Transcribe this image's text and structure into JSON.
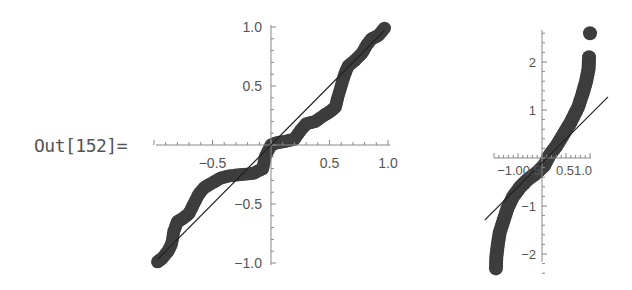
{
  "cell": {
    "out_label": "Out[152]="
  },
  "colors": {
    "dot": "#3d3d3d",
    "axis": "#888888",
    "line": "#222222",
    "text": "#555555"
  },
  "chart_data": [
    {
      "type": "scatter",
      "title": "",
      "xlabel": "",
      "ylabel": "",
      "xlim": [
        -1.0,
        1.0
      ],
      "ylim": [
        -1.0,
        1.0
      ],
      "x_ticks": [
        -0.5,
        0.5,
        1.0
      ],
      "x_tick_labels": [
        "-0.5",
        "0.5",
        "1.0"
      ],
      "y_ticks": [
        1.0,
        0.5,
        -0.5,
        -1.0
      ],
      "y_tick_labels": [
        "1.0",
        "0.5",
        "-0.5",
        "-1.0"
      ],
      "grid": false,
      "legend": null,
      "reference_line": {
        "slope": 1.0,
        "intercept": 0.0,
        "x_range": [
          -0.97,
          0.97
        ]
      },
      "series": [
        {
          "name": "quantiles",
          "x": [
            -0.97,
            -0.93,
            -0.88,
            -0.85,
            -0.83,
            -0.8,
            -0.75,
            -0.7,
            -0.66,
            -0.62,
            -0.57,
            -0.5,
            -0.43,
            -0.35,
            -0.25,
            -0.15,
            -0.07,
            -0.05,
            0.0,
            0.05,
            0.12,
            0.2,
            0.25,
            0.3,
            0.38,
            0.45,
            0.5,
            0.55,
            0.57,
            0.6,
            0.63,
            0.66,
            0.72,
            0.78,
            0.82,
            0.86,
            0.92,
            0.97
          ],
          "y": [
            -0.99,
            -0.96,
            -0.9,
            -0.84,
            -0.73,
            -0.65,
            -0.62,
            -0.58,
            -0.5,
            -0.42,
            -0.36,
            -0.32,
            -0.28,
            -0.26,
            -0.25,
            -0.24,
            -0.2,
            -0.1,
            0.0,
            0.02,
            0.03,
            0.05,
            0.12,
            0.18,
            0.2,
            0.25,
            0.28,
            0.32,
            0.4,
            0.5,
            0.6,
            0.67,
            0.72,
            0.78,
            0.85,
            0.9,
            0.93,
            0.99
          ]
        }
      ]
    },
    {
      "type": "scatter",
      "title": "",
      "xlabel": "",
      "ylabel": "",
      "xlim": [
        -1.0,
        1.0
      ],
      "ylim": [
        -2.6,
        2.7
      ],
      "x_ticks": [
        -1.0,
        -0.5,
        0.5,
        1.0
      ],
      "x_tick_labels": [
        "-1.0",
        "0.5",
        "0.5",
        "1.0"
      ],
      "x_tick_label_text": {
        "left": "-1.00.5",
        "right": "0.51.0"
      },
      "y_ticks": [
        2,
        1,
        -1,
        -2
      ],
      "y_tick_labels": [
        "2",
        "1",
        "-1",
        "-2"
      ],
      "grid": false,
      "legend": null,
      "reference_line": {
        "slope": 1.0,
        "intercept": -0.1,
        "x_range": [
          -1.19,
          1.375
        ]
      },
      "series": [
        {
          "name": "quantiles",
          "x": [
            1.0,
            0.98,
            0.97,
            0.92,
            0.85,
            0.75,
            0.6,
            0.45,
            0.3,
            0.15,
            0.05,
            -0.1,
            -0.3,
            -0.45,
            -0.6,
            -0.72,
            -0.8,
            -0.88,
            -0.92,
            -0.95,
            -0.96
          ],
          "y": [
            2.6,
            2.1,
            1.85,
            1.6,
            1.35,
            1.05,
            0.75,
            0.5,
            0.25,
            0.05,
            -0.15,
            -0.3,
            -0.45,
            -0.6,
            -0.8,
            -1.05,
            -1.3,
            -1.55,
            -1.8,
            -2.05,
            -2.3
          ]
        }
      ]
    }
  ]
}
